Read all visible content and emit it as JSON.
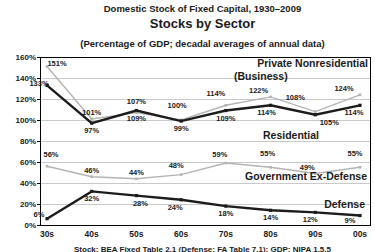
{
  "header": {
    "supertitle": "Domestic Stock of Fixed Capital, 1930–2009",
    "title": "Stocks by Sector",
    "subtitle": "(Percentage of GDP; decadal averages of annual data)"
  },
  "footer": {
    "source": "Stock: BEA Fixed Table 2.1 (Defense: FA Table 7.1); GDP: NIPA 1.5.5"
  },
  "colors": {
    "line_dark": "#1c1c1c",
    "line_gray": "#b4b4b4",
    "grid": "#c9c9c9",
    "frame": "#000000",
    "label_text": "#2a2a2a"
  },
  "chart_data": {
    "type": "line",
    "title": "Stocks by Sector",
    "subtitle": "(Percentage of GDP; decadal averages of annual data)",
    "xlabel": "",
    "ylabel": "Percentage of GDP",
    "categories": [
      "30s",
      "40s",
      "50s",
      "60s",
      "70s",
      "80s",
      "90s",
      "00s"
    ],
    "ylim": [
      0,
      160
    ],
    "ytick_step": 20,
    "ytick_labels": [
      "0%",
      "20%",
      "40%",
      "60%",
      "80%",
      "100%",
      "120%",
      "140%",
      "160%"
    ],
    "grid": true,
    "legend_position": "inline-annotations",
    "series": [
      {
        "name": "Private Nonresidential (Business)",
        "color": "#b4b4b4",
        "width": 1.4,
        "marker": 2.6,
        "values": [
          151,
          101,
          107,
          100,
          114,
          122,
          108,
          124
        ],
        "labels": [
          "151%",
          "101%",
          "107%",
          "100%",
          "114%",
          "122%",
          "108%",
          "124%"
        ],
        "label_sides": [
          "above",
          "above",
          "above",
          "above",
          "above",
          "above",
          "above",
          "above"
        ],
        "label_dx": [
          10,
          0,
          0,
          -4,
          -10,
          -12,
          -20,
          -16
        ],
        "label_dy": [
          3,
          0,
          -5,
          -9,
          -6,
          0,
          -8,
          0
        ]
      },
      {
        "name": "Residential",
        "color": "#1c1c1c",
        "width": 2.4,
        "marker": 3.2,
        "values": [
          133,
          97,
          109,
          99,
          109,
          114,
          105,
          114
        ],
        "labels": [
          "133%",
          "97%",
          "109%",
          "99%",
          "109%",
          "114%",
          "105%",
          "114%"
        ],
        "label_sides": [
          "above",
          "below",
          "below",
          "below",
          "below",
          "below",
          "below",
          "below"
        ],
        "label_dx": [
          -8,
          0,
          0,
          0,
          0,
          -4,
          14,
          -6
        ],
        "label_dy": [
          4,
          0,
          0,
          0,
          0,
          0,
          0,
          0
        ]
      },
      {
        "name": "Government Ex-Defense",
        "color": "#b4b4b4",
        "width": 1.4,
        "marker": 2.6,
        "values": [
          56,
          46,
          44,
          48,
          59,
          55,
          49,
          55
        ],
        "labels": [
          "56%",
          "46%",
          "44%",
          "48%",
          "59%",
          "55%",
          "49%",
          "55%"
        ],
        "label_sides": [
          "above",
          "above",
          "above",
          "above",
          "above",
          "above",
          "above",
          "above"
        ],
        "label_dx": [
          4,
          0,
          0,
          -5,
          -6,
          -3,
          -8,
          -5
        ],
        "label_dy": [
          -6,
          0,
          0,
          -3,
          -3,
          -8,
          0,
          -8
        ]
      },
      {
        "name": "Defense",
        "color": "#1c1c1c",
        "width": 2.4,
        "marker": 3.2,
        "values": [
          6,
          32,
          28,
          24,
          18,
          14,
          12,
          9
        ],
        "labels": [
          "6%",
          "32%",
          "28%",
          "24%",
          "18%",
          "14%",
          "12%",
          "9%"
        ],
        "label_sides": [
          "above",
          "below",
          "below",
          "below",
          "below",
          "below",
          "below",
          "below"
        ],
        "label_dx": [
          -8,
          0,
          4,
          -6,
          0,
          0,
          -5,
          -10
        ],
        "label_dy": [
          2,
          0,
          0,
          0,
          0,
          0,
          0,
          -3
        ]
      }
    ],
    "annotations": [
      {
        "text": "Private Nonresidential",
        "x": 368,
        "y": 67,
        "anchor": "end",
        "size": 10.5
      },
      {
        "text": "(Business)",
        "x": 234,
        "y": 80,
        "anchor": "start",
        "size": 10.5
      },
      {
        "text": "Residential",
        "x": 291,
        "y": 139,
        "anchor": "middle",
        "size": 10.5
      },
      {
        "text": "Government Ex-Defense",
        "x": 367,
        "y": 180,
        "anchor": "end",
        "size": 10.5
      },
      {
        "text": "Defense",
        "x": 365,
        "y": 208,
        "anchor": "end",
        "size": 10.5
      }
    ]
  }
}
